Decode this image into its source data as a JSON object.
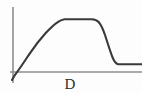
{
  "figure": {
    "background_color": "#fdfdfd",
    "axis_color": "#8e8e8e",
    "curve_color": "#3a3a3a",
    "label_color": "#2e2e2e",
    "width": 142,
    "height": 93
  },
  "labels": {
    "x_axis_label": "D"
  },
  "chart_data": {
    "type": "line",
    "title": "",
    "xlabel": "D",
    "ylabel": "",
    "grid": false,
    "legend": null,
    "axes": {
      "y_axis": {
        "x_px": 13,
        "y_top_px": 7,
        "y_bottom_px": 83
      },
      "x_axis": {
        "y_px": 72,
        "x_left_px": 10,
        "x_right_px": 142
      }
    },
    "series": [
      {
        "name": "curve",
        "points_px": [
          [
            12,
            80
          ],
          [
            14,
            76
          ],
          [
            16,
            73
          ],
          [
            18,
            70
          ],
          [
            22,
            64
          ],
          [
            27,
            56
          ],
          [
            33,
            47
          ],
          [
            39,
            39
          ],
          [
            45,
            32
          ],
          [
            51,
            26
          ],
          [
            56,
            22
          ],
          [
            61,
            20
          ],
          [
            68,
            19
          ],
          [
            78,
            19
          ],
          [
            88,
            19
          ],
          [
            95,
            20
          ],
          [
            100,
            23
          ],
          [
            104,
            30
          ],
          [
            108,
            39
          ],
          [
            112,
            49
          ],
          [
            115,
            57
          ],
          [
            117,
            62
          ],
          [
            119,
            64
          ],
          [
            124,
            64
          ],
          [
            132,
            64
          ],
          [
            142,
            64
          ]
        ]
      }
    ]
  },
  "curve_path_d": "M 12 80 C 13.5 77 15 74.5 17.2 71.8 C 21 66.8 25 60.5 29.5 53.8 C 34.5 46.4 40 39.2 45.5 33.2 C 50 28.4 54.5 24.2 58.5 21.6 C 60.6 20.2 62.5 19.5 64.5 19.2 L 92 19.2 C 94.6 19.3 96.8 20 98.6 22 C 101 24.6 103 29 105 35 C 107.5 42.5 110 51 112.6 57.5 C 114.4 61.8 116 64 118.2 64.2 L 142 64.2",
  "y_axis_path_d": "M 13 7 L 13 83",
  "x_axis_path_d": "M 10 72 L 142 72"
}
